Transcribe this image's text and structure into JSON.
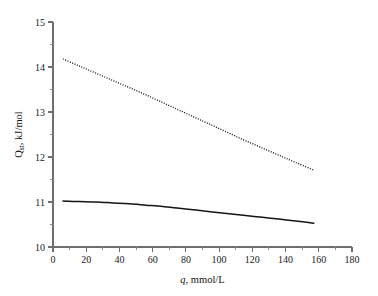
{
  "chart_data": {
    "type": "line",
    "title": "",
    "xlabel": "q, mmol/L",
    "xlabel_symbol": "q",
    "xlabel_rest": ", mmol/L",
    "ylabel": "Qst, kJ/mol",
    "ylabel_symbol": "Q",
    "ylabel_subscript": "st",
    "ylabel_rest": ", kJ/mol",
    "xlim": [
      0,
      180
    ],
    "ylim": [
      10,
      15
    ],
    "xticks": [
      0,
      20,
      40,
      60,
      80,
      100,
      120,
      140,
      160,
      180
    ],
    "xtick_labels": [
      "0",
      "20",
      "40",
      "60",
      "80",
      "100",
      "120",
      "140",
      "160",
      "180"
    ],
    "xticks_minor": [
      10,
      30,
      50,
      70,
      90,
      110,
      130,
      150,
      170
    ],
    "yticks": [
      10,
      11,
      12,
      13,
      14,
      15
    ],
    "ytick_labels": [
      "10",
      "11",
      "12",
      "13",
      "14",
      "15"
    ],
    "yticks_minor": [
      10.5,
      11.5,
      12.5,
      13.5,
      14.5
    ],
    "grid": false,
    "legend": "none",
    "series": [
      {
        "name": "upper-dotted-curve",
        "style": "dotted",
        "color": "#141414",
        "x": [
          6,
          16,
          26,
          36,
          46,
          56,
          66,
          76,
          86,
          96,
          106,
          116,
          126,
          136,
          146,
          157
        ],
        "y": [
          14.18,
          14.02,
          13.86,
          13.7,
          13.54,
          13.38,
          13.21,
          13.04,
          12.87,
          12.7,
          12.53,
          12.36,
          12.2,
          12.04,
          11.88,
          11.71
        ]
      },
      {
        "name": "lower-solid-curve",
        "style": "solid",
        "color": "#141414",
        "x": [
          6,
          16,
          26,
          36,
          46,
          56,
          66,
          76,
          86,
          96,
          106,
          116,
          126,
          136,
          146,
          157
        ],
        "y": [
          11.02,
          11.01,
          11.0,
          10.98,
          10.96,
          10.93,
          10.9,
          10.86,
          10.82,
          10.78,
          10.74,
          10.7,
          10.66,
          10.62,
          10.58,
          10.53
        ]
      }
    ]
  }
}
